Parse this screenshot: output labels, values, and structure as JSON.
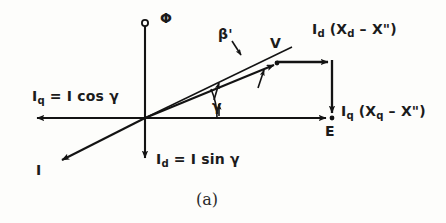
{
  "figure": {
    "caption": "(a)",
    "type": "phasor-diagram",
    "stroke_color": "#131313",
    "background_color": "#fdfdfb"
  },
  "axes": {
    "vertical": {
      "name": "flux-axis",
      "top_symbol": "Φ",
      "top_marker": "open-circle",
      "direction_down_label": "d-axis"
    },
    "horizontal": {
      "name": "q-axis",
      "direction_left_label": "q-axis"
    }
  },
  "labels": {
    "phi": "Φ",
    "beta_prime": "β'",
    "v": "V",
    "e": "E",
    "i": "I",
    "gamma": "γ",
    "id_xd": {
      "sym": "I",
      "sub": "d",
      "expr": " (X",
      "sub2": "d",
      "expr2": " – X\")"
    },
    "iq_xq": {
      "sym": "I",
      "sub": "q",
      "expr": " (X",
      "sub2": "q",
      "expr2": " – X\")"
    },
    "iq_cos": {
      "sym": "I",
      "sub": "q",
      "expr": " = I cos γ"
    },
    "id_sin": {
      "sym": "I",
      "sub": "d",
      "expr": " = I sin γ"
    }
  },
  "label_text": {
    "id_xd_full": "Id (Xd – X\")",
    "iq_xq_full": "Iq (Xq – X\")",
    "iq_cos_full": "Iq = I cos γ",
    "id_sin_full": "Id = I sin γ"
  },
  "geometry": {
    "origin": {
      "x": 145,
      "y": 118
    },
    "vertical_axis_top": {
      "x": 145,
      "y": 24
    },
    "vertical_axis_bottom": {
      "x": 145,
      "y": 163
    },
    "horizontal_axis_left_tip": {
      "x": 31,
      "y": 118
    },
    "horizontal_axis_right_end": {
      "x": 332,
      "y": 118
    },
    "v_point": {
      "x": 278,
      "y": 63
    },
    "corner_point": {
      "x": 332,
      "y": 62
    },
    "e_point": {
      "x": 332,
      "y": 118
    },
    "i_vector_tip": {
      "x": 56,
      "y": 164
    },
    "beta_line_end": {
      "x": 290,
      "y": 48
    },
    "gamma_arc_radius": 72,
    "gamma_angle_deg": 23,
    "beta_angle_deg": 29
  },
  "vectors": [
    {
      "name": "v-phasor",
      "from": "origin",
      "to": "v_point",
      "label": "V"
    },
    {
      "name": "id-drop",
      "from": "v_point",
      "to": "corner_point",
      "label": "Id (Xd – X\")"
    },
    {
      "name": "iq-drop",
      "from": "corner_point",
      "to": "e_point",
      "label": "Iq (Xq – X\")"
    },
    {
      "name": "e-phasor",
      "from": "origin",
      "to": "e_point",
      "label": "E"
    },
    {
      "name": "i-current",
      "from": "origin",
      "to": "i_vector_tip",
      "label": "I"
    },
    {
      "name": "iq-component",
      "from": "origin",
      "to": "horizontal_axis_left_tip",
      "label": "Iq = I cos γ"
    },
    {
      "name": "id-component",
      "from": "origin",
      "to": "vertical_axis_bottom",
      "label": "Id = I sin γ"
    }
  ]
}
